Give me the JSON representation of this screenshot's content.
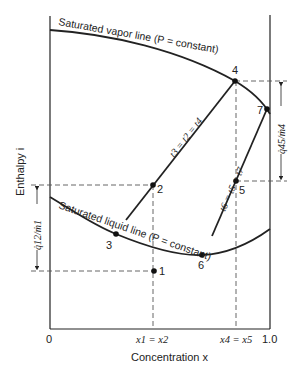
{
  "diagram": {
    "type": "enthalpy-concentration diagram",
    "axes": {
      "y_label": "Enthalpy i",
      "x_label": "Concentration x",
      "x_origin_label": "0",
      "x_end_label": "1.0",
      "x_tick_12": "x1 = x2",
      "x_tick_45": "x4 = x5"
    },
    "curves": {
      "vapor": "Saturated vapor line (P = constant)",
      "liquid": "Saturated liquid line (P = constant)"
    },
    "lines": {
      "line_324": "t3 = t2 = t4",
      "line_657": "t6 = t5 = t7"
    },
    "dimensions": {
      "q12": "q̇12/ṁ1",
      "q45": "q̇45/ṁ4"
    },
    "points": {
      "p1": "1",
      "p2": "2",
      "p3": "3",
      "p4": "4",
      "p5": "5",
      "p6": "6",
      "p7": "7"
    },
    "colors": {
      "ink": "#222222",
      "background": "#ffffff"
    }
  }
}
